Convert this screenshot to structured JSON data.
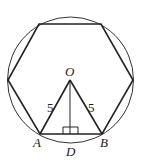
{
  "diagram": {
    "type": "regular hexagon inscribed in circle",
    "colors": {
      "stroke": "#222222",
      "background": "#ffffff"
    },
    "labels": {
      "O": "O",
      "A": "A",
      "B": "B",
      "D": "D",
      "OA_length": "5",
      "OB_length": "5"
    }
  }
}
